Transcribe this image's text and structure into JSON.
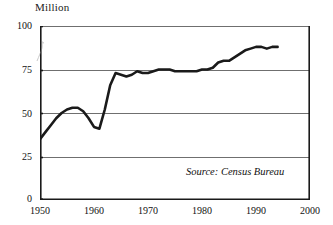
{
  "chart_data": {
    "type": "line",
    "title": "",
    "unit_label": "Million",
    "xlabel": "",
    "ylabel": "",
    "xlim": [
      1950,
      2000
    ],
    "ylim": [
      0,
      100
    ],
    "yticks": [
      0,
      25,
      50,
      75,
      100
    ],
    "ytick_labels": [
      "0",
      "25",
      "50",
      "75",
      "100"
    ],
    "xticks": [
      1950,
      1960,
      1970,
      1980,
      1990,
      2000
    ],
    "xtick_labels": [
      "1950",
      "1960",
      "1970",
      "1980",
      "1990",
      "2000"
    ],
    "grid": "horizontal",
    "legend": "none",
    "line_color": "#1a1a1a",
    "x": [
      1950,
      1951,
      1952,
      1953,
      1954,
      1955,
      1956,
      1957,
      1958,
      1959,
      1960,
      1961,
      1962,
      1963,
      1964,
      1965,
      1966,
      1967,
      1968,
      1969,
      1970,
      1971,
      1972,
      1973,
      1974,
      1975,
      1976,
      1977,
      1978,
      1979,
      1980,
      1981,
      1982,
      1983,
      1984,
      1985,
      1986,
      1987,
      1988,
      1989,
      1990,
      1991,
      1992,
      1993,
      1994
    ],
    "values": [
      35,
      39,
      43,
      47,
      50,
      52,
      53,
      53,
      51,
      47,
      42,
      41,
      52,
      66,
      73,
      72,
      71,
      72,
      74,
      73,
      73,
      74,
      75,
      75,
      75,
      74,
      74,
      74,
      74,
      74,
      75,
      75,
      76,
      79,
      80,
      80,
      82,
      84,
      86,
      87,
      88,
      88,
      87,
      88,
      88
    ],
    "annotations": [
      {
        "name": "source-note",
        "text": "Source: Census Bureau",
        "style": "italic"
      }
    ]
  },
  "axis": {
    "y_title": "Million"
  }
}
